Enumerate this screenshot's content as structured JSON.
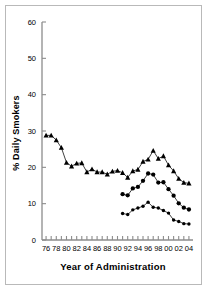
{
  "figure": {
    "border_color": "#b9b9b9",
    "background": "#ffffff",
    "ink": "#000000"
  },
  "chart_data": {
    "type": "line",
    "title": "",
    "subtitle": "",
    "xlabel": "Year of Administration",
    "ylabel": "% Daily Smokers",
    "xlim": [
      1975.2,
      2004.8
    ],
    "ylim": [
      0,
      60
    ],
    "yticks": [
      0,
      10,
      20,
      30,
      40,
      50,
      60
    ],
    "ytick_labels": [
      "0",
      "10",
      "20",
      "30",
      "40",
      "50",
      "60"
    ],
    "xticks": [
      1976,
      1977,
      1978,
      1979,
      1980,
      1981,
      1982,
      1983,
      1984,
      1985,
      1986,
      1987,
      1988,
      1989,
      1990,
      1991,
      1992,
      1993,
      1994,
      1995,
      1996,
      1997,
      1998,
      1999,
      2000,
      2001,
      2002,
      2003,
      2004
    ],
    "xtick_labels": [
      "76",
      "",
      "78",
      "",
      "80",
      "",
      "82",
      "",
      "84",
      "",
      "86",
      "",
      "88",
      "",
      "90",
      "",
      "92",
      "",
      "94",
      "",
      "96",
      "",
      "98",
      "",
      "00",
      "",
      "02",
      "",
      "04"
    ],
    "grid": false,
    "legend": "none",
    "series": [
      {
        "name": "12th Grade",
        "marker": "triangle",
        "color": "#000000",
        "x": [
          1976,
          1977,
          1978,
          1979,
          1980,
          1981,
          1982,
          1983,
          1984,
          1985,
          1986,
          1987,
          1988,
          1989,
          1990,
          1991,
          1992,
          1993,
          1994,
          1995,
          1996,
          1997,
          1998,
          1999,
          2000,
          2001,
          2002,
          2003,
          2004
        ],
        "values": [
          28.8,
          28.8,
          27.5,
          25.4,
          21.3,
          20.3,
          21.1,
          21.2,
          18.7,
          19.5,
          18.7,
          18.7,
          18.1,
          18.9,
          19.1,
          18.5,
          17.2,
          19.0,
          19.4,
          21.6,
          22.2,
          24.6,
          22.4,
          23.1,
          20.6,
          19.0,
          16.9,
          15.8,
          15.6
        ]
      },
      {
        "name": "10th Grade",
        "marker": "circle",
        "color": "#000000",
        "x": [
          1991,
          1992,
          1993,
          1994,
          1995,
          1996,
          1997,
          1998,
          1999,
          2000,
          2001,
          2002,
          2003,
          2004
        ],
        "values": [
          12.6,
          12.3,
          14.2,
          14.6,
          16.3,
          18.3,
          18.0,
          15.8,
          15.9,
          14.0,
          12.2,
          10.1,
          8.9,
          8.4
        ]
      },
      {
        "name": "8th Grade",
        "marker": "circle-small",
        "color": "#000000",
        "x": [
          1991,
          1992,
          1993,
          1994,
          1995,
          1996,
          1997,
          1998,
          1999,
          2000,
          2001,
          2002,
          2003,
          2004
        ],
        "values": [
          7.3,
          7.0,
          8.3,
          8.8,
          9.3,
          10.4,
          9.0,
          8.8,
          8.1,
          7.4,
          5.5,
          5.1,
          4.5,
          4.4
        ]
      }
    ]
  }
}
